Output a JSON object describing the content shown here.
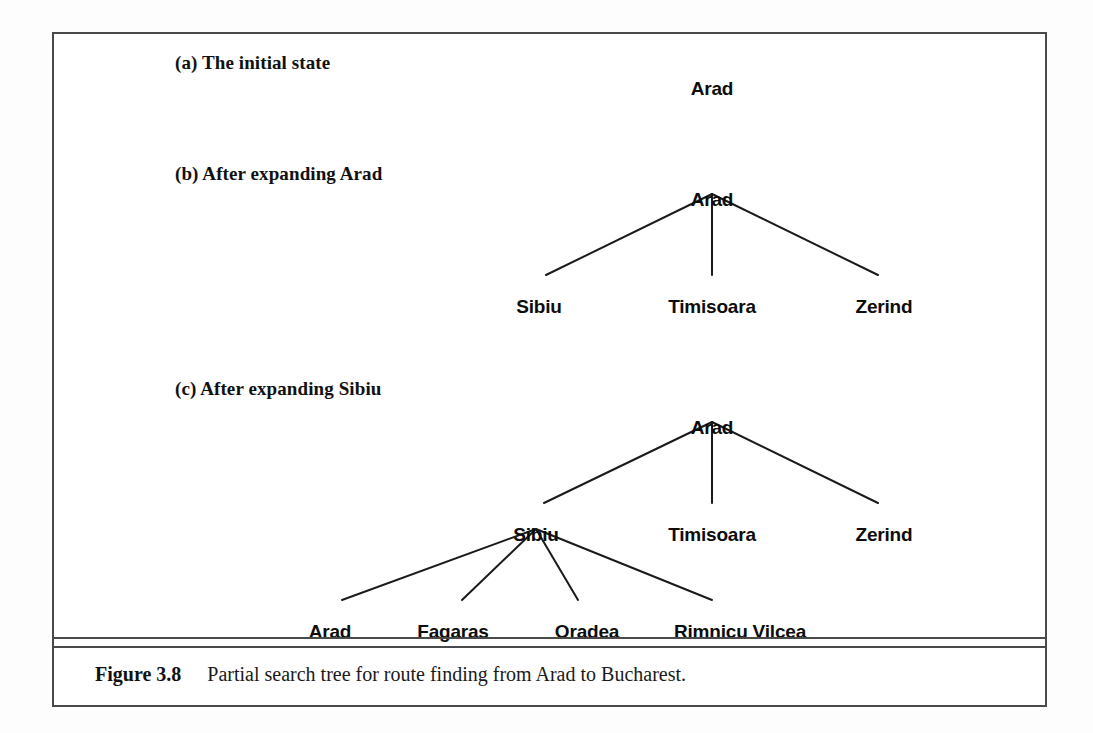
{
  "figure": {
    "sections": [
      {
        "label": "(a) The initial state",
        "label_x": 175,
        "label_y": 52
      },
      {
        "label": "(b) After expanding Arad",
        "label_x": 175,
        "label_y": 163
      },
      {
        "label": "(c) After expanding Sibiu",
        "label_x": 175,
        "label_y": 378
      }
    ],
    "caption": {
      "figure_number": "Figure 3.8",
      "text": "Partial search tree for route finding from Arad to Bucharest."
    }
  },
  "chart_data": {
    "type": "diagram",
    "diagram_kind": "search-tree",
    "title": "Partial search tree for route finding from Arad to Bucharest.",
    "panels": [
      {
        "id": "a",
        "label": "(a) The initial state",
        "nodes": [
          {
            "name": "Arad",
            "level": 0,
            "x": 712,
            "y": 78
          }
        ],
        "edges": []
      },
      {
        "id": "b",
        "label": "(b) After expanding Arad",
        "nodes": [
          {
            "name": "Arad",
            "level": 0,
            "x": 712,
            "y": 189
          },
          {
            "name": "Sibiu",
            "level": 1,
            "x": 539,
            "y": 296
          },
          {
            "name": "Timisoara",
            "level": 1,
            "x": 712,
            "y": 296
          },
          {
            "name": "Zerind",
            "level": 1,
            "x": 884,
            "y": 296
          }
        ],
        "edges": [
          {
            "from": "Arad",
            "to": "Sibiu",
            "x1": 712,
            "y1": 194,
            "x2": 546,
            "y2": 275
          },
          {
            "from": "Arad",
            "to": "Timisoara",
            "x1": 712,
            "y1": 194,
            "x2": 712,
            "y2": 275
          },
          {
            "from": "Arad",
            "to": "Zerind",
            "x1": 712,
            "y1": 194,
            "x2": 878,
            "y2": 275
          }
        ]
      },
      {
        "id": "c",
        "label": "(c) After expanding Sibiu",
        "nodes": [
          {
            "name": "Arad",
            "level": 0,
            "x": 712,
            "y": 417
          },
          {
            "name": "Sibiu",
            "level": 1,
            "x": 536,
            "y": 524
          },
          {
            "name": "Timisoara",
            "level": 1,
            "x": 712,
            "y": 524
          },
          {
            "name": "Zerind",
            "level": 1,
            "x": 884,
            "y": 524
          },
          {
            "name": "Arad",
            "level": 2,
            "x": 330,
            "y": 621
          },
          {
            "name": "Fagaras",
            "level": 2,
            "x": 453,
            "y": 621
          },
          {
            "name": "Oradea",
            "level": 2,
            "x": 587,
            "y": 621
          },
          {
            "name": "Rimnicu Vilcea",
            "level": 2,
            "x": 740,
            "y": 621
          }
        ],
        "edges": [
          {
            "from": "Arad",
            "to": "Sibiu",
            "x1": 712,
            "y1": 422,
            "x2": 544,
            "y2": 503
          },
          {
            "from": "Arad",
            "to": "Timisoara",
            "x1": 712,
            "y1": 422,
            "x2": 712,
            "y2": 503
          },
          {
            "from": "Arad",
            "to": "Zerind",
            "x1": 712,
            "y1": 422,
            "x2": 878,
            "y2": 503
          },
          {
            "from": "Sibiu",
            "to": "Arad",
            "x1": 536,
            "y1": 529,
            "x2": 342,
            "y2": 600
          },
          {
            "from": "Sibiu",
            "to": "Fagaras",
            "x1": 536,
            "y1": 529,
            "x2": 462,
            "y2": 600
          },
          {
            "from": "Sibiu",
            "to": "Oradea",
            "x1": 536,
            "y1": 529,
            "x2": 578,
            "y2": 600
          },
          {
            "from": "Sibiu",
            "to": "Rimnicu Vilcea",
            "x1": 536,
            "y1": 529,
            "x2": 712,
            "y2": 600
          }
        ]
      }
    ],
    "colors": {
      "line": "#1a1a1a",
      "text": "#0d0d0d",
      "frame": "#4a4a4a",
      "background": "#ffffff"
    }
  }
}
